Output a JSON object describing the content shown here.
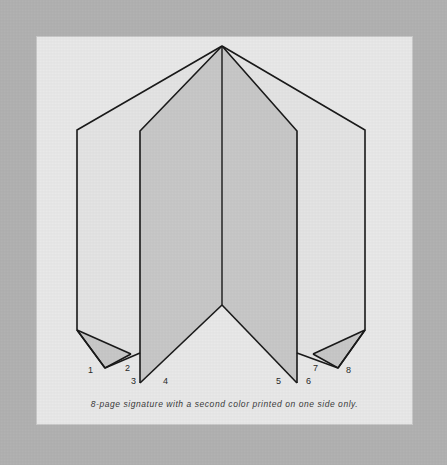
{
  "figure": {
    "caption": "8-page signature with a second color printed on one side only.",
    "background_color": "#b2b2b2",
    "plate_color": "#e9e9e9",
    "line_color": "#1a1a1a",
    "shaded_panel_color": "#c8c8c8",
    "unshaded_panel_color": "#e4e4e4",
    "flap_color": "#c8c8c8"
  },
  "page_numbers": [
    {
      "label": "1",
      "x": 88,
      "y": 372
    },
    {
      "label": "2",
      "x": 125,
      "y": 370
    },
    {
      "label": "3",
      "x": 132,
      "y": 382
    },
    {
      "label": "4",
      "x": 163,
      "y": 382
    },
    {
      "label": "5",
      "x": 276,
      "y": 382
    },
    {
      "label": "6",
      "x": 307,
      "y": 382
    },
    {
      "label": "7",
      "x": 313,
      "y": 370
    },
    {
      "label": "8",
      "x": 346,
      "y": 372
    }
  ],
  "geometry": {
    "apex": {
      "x": 222,
      "y": 46
    },
    "fold_x_positions": [
      77,
      140,
      222,
      297,
      365
    ],
    "notes": "Accordion-folded 8-page signature shown edge-on; shaded panels indicate the side carrying the second color."
  },
  "panels": [
    {
      "name": "panel-1-2-outer-left",
      "shaded": false,
      "points": "222,46 77,130 77,330 105,368 140,353 140,131"
    },
    {
      "name": "panel-3-4-inner-left",
      "shaded": true,
      "points": "222,46 140,131 140,383 222,305"
    },
    {
      "name": "panel-5-6-inner-right",
      "shaded": true,
      "points": "222,46 297,131 297,383 222,305"
    },
    {
      "name": "panel-7-8-outer-right",
      "shaded": false,
      "points": "222,46 365,130 365,330 338,368 297,353 297,131"
    },
    {
      "name": "flap-left",
      "shaded": true,
      "points": "77,330 105,368 131,354"
    },
    {
      "name": "flap-right",
      "shaded": true,
      "points": "365,330 338,368 313,354"
    }
  ]
}
